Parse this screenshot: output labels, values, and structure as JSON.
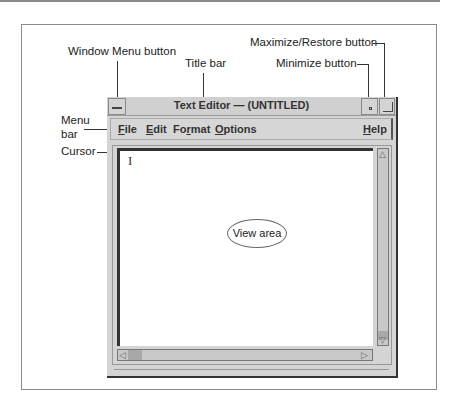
{
  "window": {
    "title": "Text Editor — (UNTITLED)",
    "menus": [
      {
        "label": "File",
        "mnemonic": "F",
        "rest": "ile"
      },
      {
        "label": "Edit",
        "mnemonic": "E",
        "rest": "dit"
      },
      {
        "label": "Format",
        "prefix": "Fo",
        "mnemonic": "r",
        "rest": "mat"
      },
      {
        "label": "Options",
        "mnemonic": "O",
        "rest": "ptions"
      },
      {
        "label": "Help",
        "mnemonic": "H",
        "rest": "elp"
      }
    ],
    "cursor_glyph": "I"
  },
  "callouts": {
    "window_menu_button": "Window Menu button",
    "title_bar": "Title bar",
    "maximize_restore_button": "Maximize/Restore button",
    "minimize_button": "Minimize button",
    "menu_bar_line1": "Menu",
    "menu_bar_line2": "bar",
    "cursor": "Cursor",
    "view_area": "View area"
  }
}
